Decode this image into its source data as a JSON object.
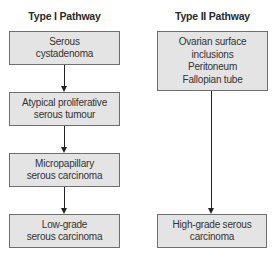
{
  "type1": {
    "title": "Type I Pathway",
    "steps": [
      "Serous\ncystadenoma",
      "Atypical proliferative\nserous tumour",
      "Micropapillary\nserous carcinoma",
      "Low-grade\nserous carcinoma"
    ]
  },
  "type2": {
    "title": "Type II Pathway",
    "steps": [
      "Ovarian surface\ninclusions\nPeritoneum\nFallopian tube",
      "High-grade serous\ncarcinoma"
    ]
  },
  "colors": {
    "box_fill": "#e4e4e4",
    "box_border": "#6e6e6e",
    "arrow": "#222222"
  }
}
